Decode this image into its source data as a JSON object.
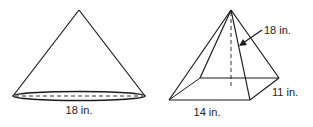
{
  "figures": {
    "cone": {
      "shape": "cone",
      "labels": {
        "base_diameter": "18 in."
      }
    },
    "pyramid": {
      "shape": "rectangular-pyramid",
      "labels": {
        "height": "18 in.",
        "base_length": "14 in.",
        "base_width": "11 in."
      }
    }
  },
  "colors": {
    "stroke": "#1a1a1a",
    "background": "#ffffff"
  }
}
